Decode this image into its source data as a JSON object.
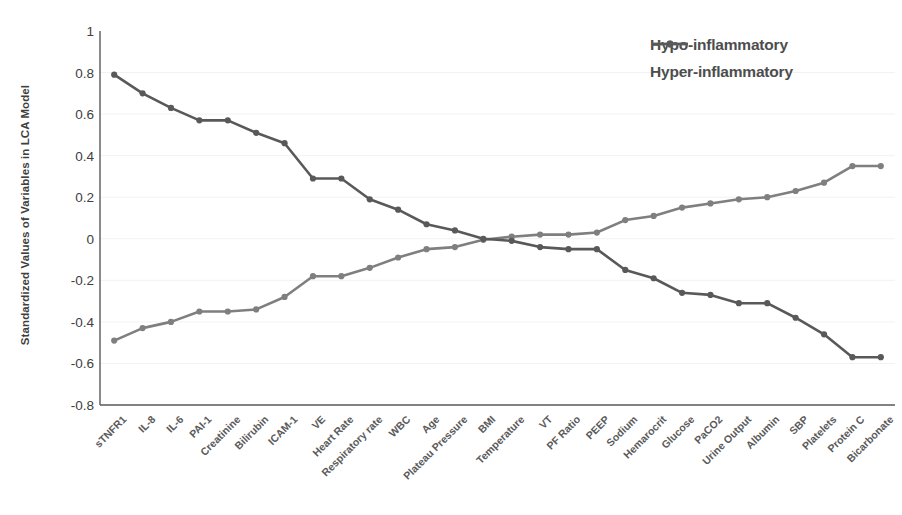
{
  "chart_data": {
    "type": "line",
    "title": "",
    "xlabel": "",
    "ylabel": "Standardized Values of Variables in LCA Model",
    "ylim": [
      -0.8,
      1
    ],
    "yticks": [
      1,
      0.8,
      0.6,
      0.4,
      0.2,
      0,
      -0.2,
      -0.4,
      -0.6,
      -0.8
    ],
    "ytick_labels": [
      "1",
      "0.8",
      "0.6",
      "0.4",
      "0.2",
      "0",
      "-0.2",
      "-0.4",
      "-0.6",
      "-0.8"
    ],
    "grid": true,
    "legend_position": "top-right",
    "categories": [
      "sTNFR1",
      "IL-8",
      "IL-6",
      "PAI-1",
      "Creatinine",
      "Bilirubin",
      "ICAM-1",
      "VE",
      "Heart Rate",
      "Respiratory rate",
      "WBC",
      "Age",
      "Plateau Pressure",
      "BMI",
      "Temperature",
      "VT",
      "PF Ratio",
      "PEEP",
      "Sodium",
      "Hemarocrit",
      "Glucose",
      "PaCO2",
      "Urine Output",
      "Albumin",
      "SBP",
      "Platelets",
      "Protein C",
      "Bicarbonate"
    ],
    "series": [
      {
        "name": "Hypo-inflammatory",
        "color": "#7f7f7f",
        "values": [
          -0.49,
          -0.43,
          -0.4,
          -0.35,
          -0.35,
          -0.34,
          -0.28,
          -0.18,
          -0.18,
          -0.14,
          -0.09,
          -0.05,
          -0.04,
          -0.005,
          0.01,
          0.02,
          0.02,
          0.03,
          0.09,
          0.11,
          0.15,
          0.17,
          0.19,
          0.2,
          0.23,
          0.27,
          0.35,
          0.35
        ]
      },
      {
        "name": "Hyper-inflammatory",
        "color": "#595959",
        "values": [
          0.79,
          0.7,
          0.63,
          0.57,
          0.57,
          0.51,
          0.46,
          0.29,
          0.29,
          0.19,
          0.14,
          0.07,
          0.04,
          0.0,
          -0.01,
          -0.04,
          -0.05,
          -0.05,
          -0.15,
          -0.19,
          -0.26,
          -0.27,
          -0.31,
          -0.31,
          -0.38,
          -0.46,
          -0.57,
          -0.57
        ]
      }
    ]
  },
  "legend": {
    "items": [
      {
        "label": "Hypo-inflammatory"
      },
      {
        "label": "Hyper-inflammatory"
      }
    ]
  }
}
